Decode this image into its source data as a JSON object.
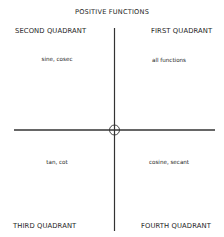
{
  "title": "POSITIVE FUNCTIONS",
  "quadrants": {
    "first": {
      "label": "FIRST QUADRANT",
      "functions": "all functions"
    },
    "second": {
      "label": "SECOND QUADRANT",
      "functions": "sine, cosec"
    },
    "third": {
      "label": "THIRD QUADRANT",
      "functions": "tan, cot"
    },
    "fourth": {
      "label": "FOURTH QUADRANT",
      "functions": "cosine, secant"
    }
  },
  "colors": {
    "line": "#333333",
    "text": "#1e1e1e",
    "background": "#ffffff"
  }
}
